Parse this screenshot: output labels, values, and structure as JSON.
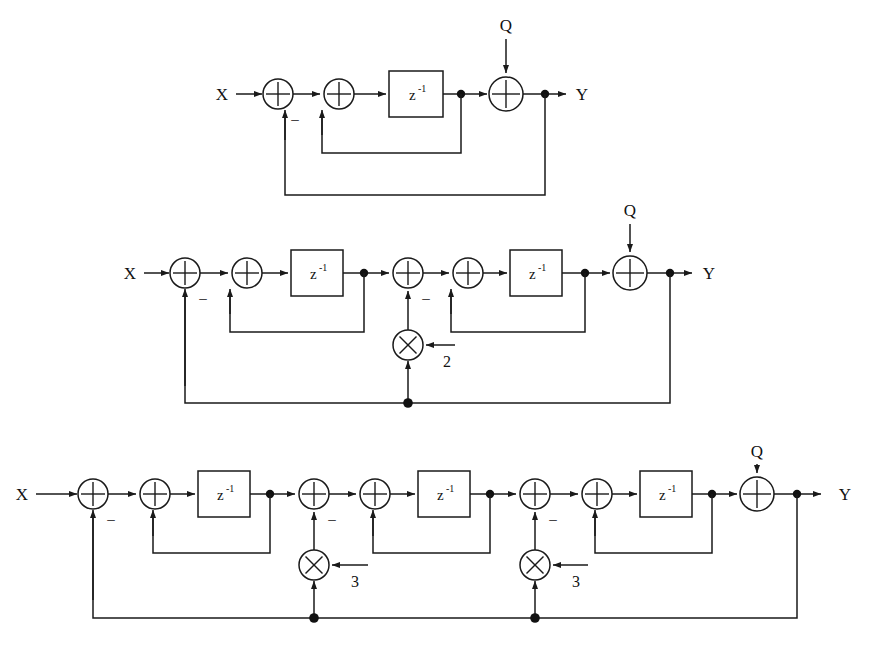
{
  "figure": {
    "type": "signal-flow-block-diagram",
    "stroke_color": "#1a1a1a",
    "background_color": "#ffffff",
    "node_color": "#111111"
  },
  "labels": {
    "input": "X",
    "output": "Y",
    "noise": "Q",
    "delay": "z",
    "delay_exponent": "-1",
    "minus": "–"
  },
  "diagrams": [
    {
      "id": "first-order",
      "order": 1,
      "name": "first-order-noise-shaper",
      "input_label": "X",
      "output_label": "Y",
      "noise_label": "Q",
      "adders": 3,
      "delays": 1,
      "multipliers": 0,
      "coefficients": [],
      "delay_label": "z⁻¹",
      "minus_signs": 1
    },
    {
      "id": "second-order",
      "order": 2,
      "name": "second-order-noise-shaper",
      "input_label": "X",
      "output_label": "Y",
      "noise_label": "Q",
      "adders": 5,
      "delays": 2,
      "multipliers": 1,
      "coefficients": [
        "2"
      ],
      "delay_label": "z⁻¹",
      "minus_signs": 2
    },
    {
      "id": "third-order",
      "order": 3,
      "name": "third-order-noise-shaper",
      "input_label": "X",
      "output_label": "Y",
      "noise_label": "Q",
      "adders": 7,
      "delays": 3,
      "multipliers": 2,
      "coefficients": [
        "3",
        "3"
      ],
      "delay_label": "z⁻¹",
      "minus_signs": 3
    }
  ],
  "row1": {
    "input_label": "X",
    "output_label": "Y",
    "noise_label": "Q",
    "z1": {
      "base": "z",
      "exp": "-1"
    },
    "minus1": "–"
  },
  "row2": {
    "input_label": "X",
    "output_label": "Y",
    "noise_label": "Q",
    "z1": {
      "base": "z",
      "exp": "-1"
    },
    "z2": {
      "base": "z",
      "exp": "-1"
    },
    "coef1": "2",
    "minus1": "–",
    "minus2": "–"
  },
  "row3": {
    "input_label": "X",
    "output_label": "Y",
    "noise_label": "Q",
    "z1": {
      "base": "z",
      "exp": "-1"
    },
    "z2": {
      "base": "z",
      "exp": "-1"
    },
    "z3": {
      "base": "z",
      "exp": "-1"
    },
    "coef1": "3",
    "coef2": "3",
    "minus1": "–",
    "minus2": "–",
    "minus3": "–"
  }
}
